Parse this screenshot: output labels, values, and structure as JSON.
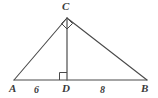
{
  "figure": {
    "kind": "geometry-diagram",
    "shape": "triangle-with-altitude",
    "stroke_color": "#4a4a4a",
    "background_color": "#ffffff",
    "text_color": "#3a3a3a"
  },
  "vertices": {
    "A": {
      "label": "A",
      "x": 14,
      "y": 80
    },
    "B": {
      "label": "B",
      "x": 147,
      "y": 80
    },
    "C": {
      "label": "C",
      "x": 67,
      "y": 18
    },
    "D": {
      "label": "D",
      "x": 67,
      "y": 80
    }
  },
  "segments": {
    "AD": {
      "label": "6",
      "value": 6
    },
    "DB": {
      "label": "8",
      "value": 8
    }
  },
  "right_angles": [
    {
      "name": "right-angle-at-C",
      "vertex": "C"
    },
    {
      "name": "right-angle-at-D",
      "vertex": "D"
    }
  ]
}
